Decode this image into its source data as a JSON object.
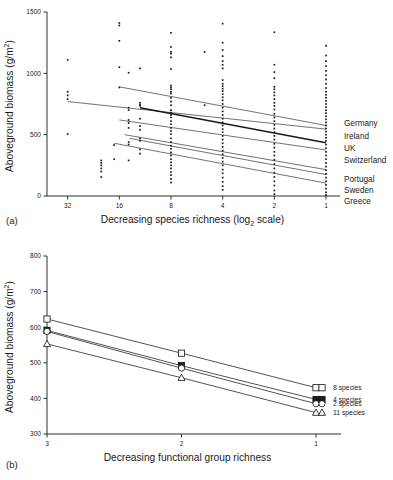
{
  "figure": {
    "panel_a_label": "(a)",
    "panel_b_label": "(b)"
  },
  "chart_data": [
    {
      "id": "panel-a",
      "type": "scatter",
      "title": "",
      "xlabel": "Decreasing species richness (log",
      "xlabel_sub": "2",
      "xlabel_tail": " scale)",
      "ylabel": "Aboveground biomass (g/m",
      "ylabel_sup": "2",
      "ylabel_tail": ")",
      "xticks": [
        "32",
        "16",
        "8",
        "4",
        "2",
        "1"
      ],
      "xtick_values": [
        32,
        16,
        8,
        4,
        2,
        1
      ],
      "yticks": [
        "0",
        "500",
        "1000",
        "1500"
      ],
      "ytick_values": [
        0,
        500,
        1000,
        1500
      ],
      "ylim": [
        0,
        1500
      ],
      "xlim_log2": [
        5.4,
        0.0
      ],
      "grid": false,
      "legend_position": "right",
      "legend": [
        "Germany",
        "Ireland",
        "UK",
        "Switzerland",
        "Portugal",
        "Sweden",
        "Greece"
      ],
      "regression_lines": [
        {
          "name": "Germany",
          "x_log2_start": 4.0,
          "y_start": 890,
          "x_log2_end": 0.0,
          "y_end": 575,
          "bold": false
        },
        {
          "name": "Ireland",
          "x_log2_start": 5.0,
          "y_start": 770,
          "x_log2_end": 0.0,
          "y_end": 545,
          "bold": false
        },
        {
          "name": "UK",
          "x_log2_start": 3.6,
          "y_start": 720,
          "x_log2_end": 0.0,
          "y_end": 435,
          "bold": true
        },
        {
          "name": "Switzerland",
          "x_log2_start": 4.0,
          "y_start": 620,
          "x_log2_end": 0.0,
          "y_end": 375,
          "bold": false
        },
        {
          "name": "Portugal",
          "x_log2_start": 3.9,
          "y_start": 500,
          "x_log2_end": 0.0,
          "y_end": 215,
          "bold": false
        },
        {
          "name": "Sweden",
          "x_log2_start": 3.8,
          "y_start": 470,
          "x_log2_end": 0.0,
          "y_end": 175,
          "bold": false
        },
        {
          "name": "Greece",
          "x_log2_start": 4.1,
          "y_start": 430,
          "x_log2_end": 0.0,
          "y_end": 105,
          "bold": false
        }
      ],
      "points": [
        {
          "x_log2": 5.0,
          "y": 1110
        },
        {
          "x_log2": 5.0,
          "y": 850
        },
        {
          "x_log2": 5.0,
          "y": 820
        },
        {
          "x_log2": 5.0,
          "y": 790
        },
        {
          "x_log2": 5.0,
          "y": 505
        },
        {
          "x_log2": 4.0,
          "y": 1410
        },
        {
          "x_log2": 4.0,
          "y": 1390
        },
        {
          "x_log2": 4.0,
          "y": 1265
        },
        {
          "x_log2": 4.0,
          "y": 1050
        },
        {
          "x_log2": 4.0,
          "y": 885
        },
        {
          "x_log2": 4.35,
          "y": 290
        },
        {
          "x_log2": 4.35,
          "y": 270
        },
        {
          "x_log2": 4.35,
          "y": 250
        },
        {
          "x_log2": 4.35,
          "y": 225
        },
        {
          "x_log2": 4.35,
          "y": 200
        },
        {
          "x_log2": 4.35,
          "y": 155
        },
        {
          "x_log2": 4.1,
          "y": 415
        },
        {
          "x_log2": 4.1,
          "y": 300
        },
        {
          "x_log2": 3.82,
          "y": 1005
        },
        {
          "x_log2": 3.82,
          "y": 720
        },
        {
          "x_log2": 3.82,
          "y": 700
        },
        {
          "x_log2": 3.82,
          "y": 620
        },
        {
          "x_log2": 3.82,
          "y": 595
        },
        {
          "x_log2": 3.82,
          "y": 555
        },
        {
          "x_log2": 3.82,
          "y": 440
        },
        {
          "x_log2": 3.82,
          "y": 420
        },
        {
          "x_log2": 3.82,
          "y": 290
        },
        {
          "x_log2": 3.6,
          "y": 1040
        },
        {
          "x_log2": 3.6,
          "y": 760
        },
        {
          "x_log2": 3.6,
          "y": 745
        },
        {
          "x_log2": 3.6,
          "y": 735
        },
        {
          "x_log2": 3.6,
          "y": 630
        },
        {
          "x_log2": 3.6,
          "y": 570
        },
        {
          "x_log2": 3.6,
          "y": 540
        },
        {
          "x_log2": 3.6,
          "y": 470
        },
        {
          "x_log2": 3.6,
          "y": 450
        },
        {
          "x_log2": 3.6,
          "y": 380
        },
        {
          "x_log2": 3.6,
          "y": 345
        },
        {
          "x_log2": 3.0,
          "y": 1330
        },
        {
          "x_log2": 3.0,
          "y": 1215
        },
        {
          "x_log2": 3.0,
          "y": 1175
        },
        {
          "x_log2": 3.0,
          "y": 1160
        },
        {
          "x_log2": 3.0,
          "y": 1130
        },
        {
          "x_log2": 3.0,
          "y": 1035
        },
        {
          "x_log2": 3.0,
          "y": 900
        },
        {
          "x_log2": 3.0,
          "y": 885
        },
        {
          "x_log2": 3.0,
          "y": 870
        },
        {
          "x_log2": 3.0,
          "y": 850
        },
        {
          "x_log2": 3.0,
          "y": 835
        },
        {
          "x_log2": 3.0,
          "y": 800
        },
        {
          "x_log2": 3.0,
          "y": 770
        },
        {
          "x_log2": 3.0,
          "y": 740
        },
        {
          "x_log2": 3.0,
          "y": 700
        },
        {
          "x_log2": 3.0,
          "y": 680
        },
        {
          "x_log2": 3.0,
          "y": 660
        },
        {
          "x_log2": 3.0,
          "y": 640
        },
        {
          "x_log2": 3.0,
          "y": 610
        },
        {
          "x_log2": 3.0,
          "y": 585
        },
        {
          "x_log2": 3.0,
          "y": 555
        },
        {
          "x_log2": 3.0,
          "y": 530
        },
        {
          "x_log2": 3.0,
          "y": 505
        },
        {
          "x_log2": 3.0,
          "y": 470
        },
        {
          "x_log2": 3.0,
          "y": 440
        },
        {
          "x_log2": 3.0,
          "y": 410
        },
        {
          "x_log2": 3.0,
          "y": 385
        },
        {
          "x_log2": 3.0,
          "y": 355
        },
        {
          "x_log2": 3.0,
          "y": 330
        },
        {
          "x_log2": 3.0,
          "y": 300
        },
        {
          "x_log2": 3.0,
          "y": 275
        },
        {
          "x_log2": 3.0,
          "y": 250
        },
        {
          "x_log2": 3.0,
          "y": 225
        },
        {
          "x_log2": 3.0,
          "y": 195
        },
        {
          "x_log2": 3.0,
          "y": 170
        },
        {
          "x_log2": 3.0,
          "y": 140
        },
        {
          "x_log2": 3.0,
          "y": 110
        },
        {
          "x_log2": 2.0,
          "y": 1405
        },
        {
          "x_log2": 2.0,
          "y": 1250
        },
        {
          "x_log2": 2.0,
          "y": 1190
        },
        {
          "x_log2": 2.0,
          "y": 1140
        },
        {
          "x_log2": 2.0,
          "y": 1100
        },
        {
          "x_log2": 2.0,
          "y": 1070
        },
        {
          "x_log2": 2.0,
          "y": 1040
        },
        {
          "x_log2": 2.0,
          "y": 945
        },
        {
          "x_log2": 2.0,
          "y": 915
        },
        {
          "x_log2": 2.0,
          "y": 895
        },
        {
          "x_log2": 2.0,
          "y": 875
        },
        {
          "x_log2": 2.0,
          "y": 855
        },
        {
          "x_log2": 2.0,
          "y": 830
        },
        {
          "x_log2": 2.0,
          "y": 805
        },
        {
          "x_log2": 2.0,
          "y": 780
        },
        {
          "x_log2": 2.0,
          "y": 750
        },
        {
          "x_log2": 2.0,
          "y": 720
        },
        {
          "x_log2": 2.0,
          "y": 690
        },
        {
          "x_log2": 2.0,
          "y": 660
        },
        {
          "x_log2": 2.0,
          "y": 630
        },
        {
          "x_log2": 2.0,
          "y": 600
        },
        {
          "x_log2": 2.0,
          "y": 575
        },
        {
          "x_log2": 2.0,
          "y": 545
        },
        {
          "x_log2": 2.0,
          "y": 520
        },
        {
          "x_log2": 2.0,
          "y": 490
        },
        {
          "x_log2": 2.0,
          "y": 460
        },
        {
          "x_log2": 2.0,
          "y": 430
        },
        {
          "x_log2": 2.0,
          "y": 400
        },
        {
          "x_log2": 2.0,
          "y": 370
        },
        {
          "x_log2": 2.0,
          "y": 340
        },
        {
          "x_log2": 2.0,
          "y": 310
        },
        {
          "x_log2": 2.0,
          "y": 280
        },
        {
          "x_log2": 2.0,
          "y": 250
        },
        {
          "x_log2": 2.0,
          "y": 215
        },
        {
          "x_log2": 2.0,
          "y": 185
        },
        {
          "x_log2": 2.0,
          "y": 150
        },
        {
          "x_log2": 2.0,
          "y": 115
        },
        {
          "x_log2": 2.0,
          "y": 80
        },
        {
          "x_log2": 2.0,
          "y": 50
        },
        {
          "x_log2": 2.35,
          "y": 1175
        },
        {
          "x_log2": 2.35,
          "y": 740
        },
        {
          "x_log2": 1.0,
          "y": 1335
        },
        {
          "x_log2": 1.0,
          "y": 1070
        },
        {
          "x_log2": 1.0,
          "y": 1010
        },
        {
          "x_log2": 1.0,
          "y": 960
        },
        {
          "x_log2": 1.0,
          "y": 890
        },
        {
          "x_log2": 1.0,
          "y": 870
        },
        {
          "x_log2": 1.0,
          "y": 845
        },
        {
          "x_log2": 1.0,
          "y": 820
        },
        {
          "x_log2": 1.0,
          "y": 790
        },
        {
          "x_log2": 1.0,
          "y": 760
        },
        {
          "x_log2": 1.0,
          "y": 735
        },
        {
          "x_log2": 1.0,
          "y": 705
        },
        {
          "x_log2": 1.0,
          "y": 670
        },
        {
          "x_log2": 1.0,
          "y": 640
        },
        {
          "x_log2": 1.0,
          "y": 610
        },
        {
          "x_log2": 1.0,
          "y": 580
        },
        {
          "x_log2": 1.0,
          "y": 550
        },
        {
          "x_log2": 1.0,
          "y": 520
        },
        {
          "x_log2": 1.0,
          "y": 490
        },
        {
          "x_log2": 1.0,
          "y": 460
        },
        {
          "x_log2": 1.0,
          "y": 425
        },
        {
          "x_log2": 1.0,
          "y": 395
        },
        {
          "x_log2": 1.0,
          "y": 360
        },
        {
          "x_log2": 1.0,
          "y": 330
        },
        {
          "x_log2": 1.0,
          "y": 295
        },
        {
          "x_log2": 1.0,
          "y": 260
        },
        {
          "x_log2": 1.0,
          "y": 225
        },
        {
          "x_log2": 1.0,
          "y": 190
        },
        {
          "x_log2": 1.0,
          "y": 155
        },
        {
          "x_log2": 1.0,
          "y": 120
        },
        {
          "x_log2": 1.0,
          "y": 85
        },
        {
          "x_log2": 1.0,
          "y": 45
        },
        {
          "x_log2": 1.0,
          "y": 15
        },
        {
          "x_log2": 0.0,
          "y": 1225
        },
        {
          "x_log2": 0.0,
          "y": 1145
        },
        {
          "x_log2": 0.0,
          "y": 1100
        },
        {
          "x_log2": 0.0,
          "y": 1060
        },
        {
          "x_log2": 0.0,
          "y": 1020
        },
        {
          "x_log2": 0.0,
          "y": 985
        },
        {
          "x_log2": 0.0,
          "y": 950
        },
        {
          "x_log2": 0.0,
          "y": 915
        },
        {
          "x_log2": 0.0,
          "y": 880
        },
        {
          "x_log2": 0.0,
          "y": 850
        },
        {
          "x_log2": 0.0,
          "y": 825
        },
        {
          "x_log2": 0.0,
          "y": 800
        },
        {
          "x_log2": 0.0,
          "y": 775
        },
        {
          "x_log2": 0.0,
          "y": 750
        },
        {
          "x_log2": 0.0,
          "y": 725
        },
        {
          "x_log2": 0.0,
          "y": 700
        },
        {
          "x_log2": 0.0,
          "y": 675
        },
        {
          "x_log2": 0.0,
          "y": 650
        },
        {
          "x_log2": 0.0,
          "y": 625
        },
        {
          "x_log2": 0.0,
          "y": 600
        },
        {
          "x_log2": 0.0,
          "y": 575
        },
        {
          "x_log2": 0.0,
          "y": 550
        },
        {
          "x_log2": 0.0,
          "y": 525
        },
        {
          "x_log2": 0.0,
          "y": 500
        },
        {
          "x_log2": 0.0,
          "y": 475
        },
        {
          "x_log2": 0.0,
          "y": 450
        },
        {
          "x_log2": 0.0,
          "y": 420
        },
        {
          "x_log2": 0.0,
          "y": 390
        },
        {
          "x_log2": 0.0,
          "y": 360
        },
        {
          "x_log2": 0.0,
          "y": 330
        },
        {
          "x_log2": 0.0,
          "y": 300
        },
        {
          "x_log2": 0.0,
          "y": 270
        },
        {
          "x_log2": 0.0,
          "y": 240
        },
        {
          "x_log2": 0.0,
          "y": 210
        },
        {
          "x_log2": 0.0,
          "y": 180
        },
        {
          "x_log2": 0.0,
          "y": 150
        },
        {
          "x_log2": 0.0,
          "y": 120
        },
        {
          "x_log2": 0.0,
          "y": 90
        },
        {
          "x_log2": 0.0,
          "y": 60
        },
        {
          "x_log2": 0.0,
          "y": 30
        },
        {
          "x_log2": 0.0,
          "y": 8
        }
      ]
    },
    {
      "id": "panel-b",
      "type": "line",
      "title": "",
      "xlabel": "Decreasing functional group richness",
      "ylabel": "Aboveground biomass (g/m",
      "ylabel_sup": "2",
      "ylabel_tail": ")",
      "categories": [
        "3",
        "2",
        "1"
      ],
      "xticks": [
        "3",
        "2",
        "1"
      ],
      "yticks": [
        "300",
        "400",
        "500",
        "600",
        "700",
        "800"
      ],
      "ytick_values": [
        300,
        400,
        500,
        600,
        700,
        800
      ],
      "ylim": [
        300,
        800
      ],
      "grid": false,
      "legend_position": "right",
      "series": [
        {
          "name": "8 species",
          "marker": "open-square",
          "values": [
            623,
            527,
            430
          ]
        },
        {
          "name": "4 species",
          "marker": "filled-square",
          "values": [
            591,
            492,
            397
          ]
        },
        {
          "name": "2 species",
          "marker": "open-circle",
          "values": [
            588,
            485,
            385
          ]
        },
        {
          "name": "11 species",
          "marker": "open-triangle",
          "values": [
            553,
            458,
            360
          ]
        }
      ]
    }
  ]
}
